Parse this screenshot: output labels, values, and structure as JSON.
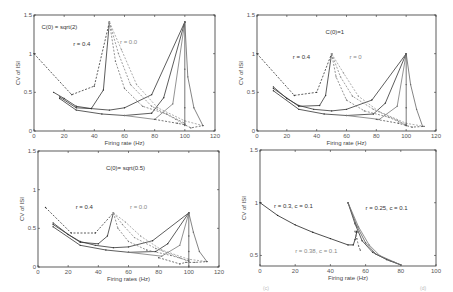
{
  "chart_data": [
    {
      "type": "line",
      "panel": "top-left",
      "annotations": [
        {
          "text": "C(0) = sqrt(2)",
          "x": 5,
          "y": 1.32
        },
        {
          "text": "r = 0.4",
          "x": 26,
          "y": 1.1
        },
        {
          "text": "r = 0.0",
          "x": 57,
          "y": 1.12,
          "light": true
        }
      ],
      "xlabel": "Firing rate (Hz)",
      "ylabel": "CV of ISI",
      "xlim": [
        0,
        120
      ],
      "ylim": [
        0,
        1.5
      ],
      "xticks": [
        0,
        20,
        40,
        60,
        80,
        100,
        120
      ],
      "yticks": [
        0,
        0.5,
        1,
        1.5
      ],
      "ytick_labels": [
        "0",
        "0.5",
        "1",
        "1.5"
      ],
      "series": [
        {
          "name": "r=0.4 dashed",
          "style": "dashed",
          "color": "#333333",
          "x": [
            0,
            25,
            40,
            50
          ],
          "y": [
            1.0,
            0.47,
            0.58,
            1.41
          ]
        },
        {
          "name": "r=0.4 branch a",
          "style": "solid",
          "color": "#333333",
          "x": [
            13,
            20,
            28,
            38,
            50,
            60,
            78,
            100
          ],
          "y": [
            0.5,
            0.42,
            0.32,
            0.29,
            0.27,
            0.3,
            0.47,
            1.41
          ]
        },
        {
          "name": "r=0.4 branch b",
          "style": "solid",
          "color": "#333333",
          "x": [
            17,
            28,
            38,
            46,
            50
          ],
          "y": [
            0.44,
            0.3,
            0.29,
            0.53,
            1.41
          ]
        },
        {
          "name": "r=0 low",
          "style": "solid",
          "color": "#333333",
          "x": [
            17,
            28,
            45,
            60,
            78,
            86,
            100
          ],
          "y": [
            0.42,
            0.27,
            0.22,
            0.2,
            0.23,
            0.43,
            1.41
          ]
        },
        {
          "name": "r=0 drop1",
          "style": "dashed",
          "color": "#777777",
          "x": [
            50,
            54,
            60,
            72,
            88,
            100
          ],
          "y": [
            1.41,
            0.9,
            0.55,
            0.32,
            0.22,
            0.1
          ]
        },
        {
          "name": "r=0 drop2",
          "style": "dashed",
          "color": "#888888",
          "x": [
            50,
            56,
            64,
            78,
            94,
            100
          ],
          "y": [
            1.41,
            1.0,
            0.6,
            0.32,
            0.15,
            0.08
          ]
        },
        {
          "name": "r=0 drop3",
          "style": "dashed",
          "color": "#999999",
          "x": [
            50,
            58,
            68,
            82,
            100,
            112
          ],
          "y": [
            1.41,
            1.05,
            0.6,
            0.3,
            0.13,
            0.07
          ]
        },
        {
          "name": "r=0 rise1",
          "style": "solid",
          "color": "#777777",
          "x": [
            60,
            80,
            92,
            100
          ],
          "y": [
            0.2,
            0.15,
            0.35,
            1.41
          ]
        },
        {
          "name": "peak100 drop",
          "style": "solid",
          "color": "#555555",
          "x": [
            100,
            100,
            100,
            100
          ],
          "y": [
            1.41,
            0.8,
            0.3,
            0.07
          ]
        },
        {
          "name": "peak100 drop right",
          "style": "solid",
          "color": "#666666",
          "x": [
            100,
            102,
            106,
            112
          ],
          "y": [
            1.41,
            0.7,
            0.3,
            0.07
          ]
        },
        {
          "name": "tail dashed",
          "style": "dashed",
          "color": "#555555",
          "x": [
            80,
            95,
            100,
            104,
            112
          ],
          "y": [
            0.15,
            0.1,
            0.08,
            0.04,
            0.07
          ]
        }
      ]
    },
    {
      "type": "line",
      "panel": "top-right",
      "annotations": [
        {
          "text": "C(0)=1",
          "x": 46,
          "y": 1.25
        },
        {
          "text": "r = 0.4",
          "x": 24,
          "y": 0.93
        },
        {
          "text": "r = 0",
          "x": 62,
          "y": 0.93,
          "light": true
        }
      ],
      "xlabel": "Firing rate (Hz)",
      "ylabel": "CV of ISI",
      "xlim": [
        0,
        120
      ],
      "ylim": [
        0,
        1.5
      ],
      "xticks": [
        0,
        20,
        40,
        60,
        80,
        100,
        120
      ],
      "yticks": [
        0,
        0.5,
        1,
        1.5
      ],
      "ytick_labels": [
        "0",
        "0.5",
        "1",
        "1.5"
      ],
      "series": [
        {
          "name": "r=0.4 dashed",
          "style": "dashed",
          "color": "#333333",
          "x": [
            0,
            25,
            40,
            50
          ],
          "y": [
            1.0,
            0.46,
            0.5,
            1.0
          ]
        },
        {
          "name": "r=0.4 branch a",
          "style": "solid",
          "color": "#333333",
          "x": [
            11,
            20,
            28,
            38,
            50,
            60,
            77,
            100
          ],
          "y": [
            0.57,
            0.42,
            0.33,
            0.28,
            0.26,
            0.28,
            0.4,
            1.0
          ]
        },
        {
          "name": "r=0.4 branch b",
          "style": "solid",
          "color": "#333333",
          "x": [
            11,
            28,
            42,
            46,
            50
          ],
          "y": [
            0.55,
            0.32,
            0.33,
            0.46,
            1.0
          ]
        },
        {
          "name": "r=0 low",
          "style": "solid",
          "color": "#333333",
          "x": [
            11,
            28,
            45,
            60,
            78,
            86,
            100
          ],
          "y": [
            0.52,
            0.28,
            0.22,
            0.2,
            0.22,
            0.36,
            1.0
          ]
        },
        {
          "name": "r=0 drop1",
          "style": "dashed",
          "color": "#777777",
          "x": [
            50,
            53,
            60,
            72,
            88,
            100
          ],
          "y": [
            1.0,
            0.7,
            0.4,
            0.26,
            0.18,
            0.08
          ]
        },
        {
          "name": "r=0 drop2",
          "style": "dashed",
          "color": "#888888",
          "x": [
            50,
            56,
            64,
            78,
            94,
            100
          ],
          "y": [
            1.0,
            0.7,
            0.45,
            0.28,
            0.14,
            0.07
          ]
        },
        {
          "name": "r=0 drop3",
          "style": "dashed",
          "color": "#999999",
          "x": [
            50,
            58,
            68,
            82,
            100,
            112
          ],
          "y": [
            1.0,
            0.75,
            0.45,
            0.25,
            0.1,
            0.06
          ]
        },
        {
          "name": "r=0 rise1",
          "style": "solid",
          "color": "#777777",
          "x": [
            60,
            82,
            94,
            100
          ],
          "y": [
            0.2,
            0.15,
            0.32,
            1.0
          ]
        },
        {
          "name": "peak100 drop",
          "style": "solid",
          "color": "#555555",
          "x": [
            100,
            100,
            100,
            100
          ],
          "y": [
            1.0,
            0.6,
            0.3,
            0.07
          ]
        },
        {
          "name": "peak100 drop right",
          "style": "solid",
          "color": "#666666",
          "x": [
            100,
            103,
            107,
            111
          ],
          "y": [
            1.0,
            0.6,
            0.28,
            0.06
          ]
        },
        {
          "name": "tail dashed",
          "style": "dashed",
          "color": "#555555",
          "x": [
            80,
            95,
            100,
            104,
            112
          ],
          "y": [
            0.15,
            0.1,
            0.07,
            0.05,
            0.06
          ]
        }
      ]
    },
    {
      "type": "line",
      "panel": "bottom-left",
      "annotations": [
        {
          "text": "C(0)= sqrt(0.5)",
          "x": 45,
          "y": 1.25
        },
        {
          "text": "r = 0.4",
          "x": 25,
          "y": 0.75
        },
        {
          "text": "r = 0.0",
          "x": 61,
          "y": 0.75,
          "light": true
        }
      ],
      "xlabel": "Firing rates (Hz)",
      "ylabel": "CV of ISI",
      "xlim": [
        0,
        120
      ],
      "ylim": [
        0,
        1.5
      ],
      "xticks": [
        0,
        20,
        40,
        60,
        80,
        100,
        120
      ],
      "yticks": [
        0,
        0.5,
        1,
        1.5
      ],
      "ytick_labels": [
        "0",
        "0.5",
        "1",
        "1.5"
      ],
      "series": [
        {
          "name": "r=0.4 dashed",
          "style": "dashed",
          "color": "#333333",
          "x": [
            5,
            22,
            38,
            50
          ],
          "y": [
            0.77,
            0.44,
            0.44,
            0.7
          ]
        },
        {
          "name": "r=0.4 branch a",
          "style": "solid",
          "color": "#333333",
          "x": [
            10,
            20,
            28,
            38,
            50,
            60,
            76,
            100
          ],
          "y": [
            0.57,
            0.42,
            0.33,
            0.28,
            0.25,
            0.26,
            0.34,
            0.7
          ]
        },
        {
          "name": "r=0.4 branch b",
          "style": "solid",
          "color": "#333333",
          "x": [
            10,
            28,
            40,
            46,
            50
          ],
          "y": [
            0.55,
            0.32,
            0.3,
            0.4,
            0.7
          ]
        },
        {
          "name": "r=0 low",
          "style": "solid",
          "color": "#333333",
          "x": [
            10,
            28,
            45,
            60,
            78,
            86,
            100
          ],
          "y": [
            0.52,
            0.28,
            0.22,
            0.19,
            0.2,
            0.3,
            0.7
          ]
        },
        {
          "name": "r=0 drop1",
          "style": "dashed",
          "color": "#777777",
          "x": [
            50,
            53,
            60,
            72,
            88,
            100
          ],
          "y": [
            0.7,
            0.5,
            0.33,
            0.22,
            0.15,
            0.08
          ]
        },
        {
          "name": "r=0 drop2",
          "style": "dashed",
          "color": "#888888",
          "x": [
            50,
            56,
            64,
            78,
            94,
            100
          ],
          "y": [
            0.7,
            0.55,
            0.38,
            0.24,
            0.12,
            0.07
          ]
        },
        {
          "name": "r=0 drop3",
          "style": "dashed",
          "color": "#999999",
          "x": [
            50,
            58,
            68,
            82,
            100,
            112
          ],
          "y": [
            0.7,
            0.58,
            0.4,
            0.22,
            0.1,
            0.07
          ]
        },
        {
          "name": "r=0 rise1",
          "style": "solid",
          "color": "#777777",
          "x": [
            60,
            82,
            94,
            100
          ],
          "y": [
            0.19,
            0.14,
            0.28,
            0.7
          ]
        },
        {
          "name": "peak100 drop",
          "style": "solid",
          "color": "#555555",
          "x": [
            100,
            100,
            100,
            100
          ],
          "y": [
            0.7,
            0.4,
            0.2,
            0.0
          ]
        },
        {
          "name": "peak100 drop right",
          "style": "solid",
          "color": "#666666",
          "x": [
            100,
            103,
            107,
            112
          ],
          "y": [
            0.7,
            0.45,
            0.2,
            0.07
          ]
        },
        {
          "name": "tail dashed",
          "style": "dashed",
          "color": "#555555",
          "x": [
            80,
            94,
            98,
            104,
            112
          ],
          "y": [
            0.12,
            0.04,
            0.06,
            0.06,
            0.07
          ]
        }
      ]
    },
    {
      "type": "line",
      "panel": "bottom-right",
      "annotations": [
        {
          "text": "r = 0.3, c = 0.1",
          "x": 8,
          "y": 0.95
        },
        {
          "text": "r = 0.25, c = 0.1",
          "x": 60,
          "y": 0.93
        },
        {
          "text": "r = 0.38, c = 0.1",
          "x": 20,
          "y": 0.52,
          "light": true
        }
      ],
      "xlabel": "Firing rate (Hz)",
      "ylabel": "CV of ISI",
      "xlim": [
        0,
        100
      ],
      "ylim": [
        0.4,
        1.5
      ],
      "xticks": [
        0,
        20,
        40,
        60,
        80,
        100
      ],
      "yticks": [
        0.5,
        1,
        1.5
      ],
      "ytick_labels": [
        "0.5",
        "1",
        "1.5"
      ],
      "series": [
        {
          "name": "r=0.3 c=0.1",
          "style": "solid",
          "color": "#222222",
          "x": [
            0,
            10,
            20,
            30,
            40,
            50,
            53,
            54,
            55,
            55
          ],
          "y": [
            1.0,
            0.88,
            0.79,
            0.72,
            0.66,
            0.6,
            0.6,
            0.65,
            0.72,
            0.73
          ]
        },
        {
          "name": "r=0.25 c=0.1 a",
          "style": "solid",
          "color": "#333333",
          "x": [
            50,
            54,
            58,
            64,
            72,
            80
          ],
          "y": [
            1.0,
            0.8,
            0.64,
            0.53,
            0.46,
            0.41
          ]
        },
        {
          "name": "r=0.25 c=0.1 b",
          "style": "solid",
          "color": "#555555",
          "x": [
            50,
            55,
            60,
            66,
            74,
            80
          ],
          "y": [
            1.0,
            0.78,
            0.62,
            0.51,
            0.45,
            0.41
          ]
        },
        {
          "name": "r=0.25 c=0.1 c",
          "style": "solid",
          "color": "#777777",
          "x": [
            50,
            56,
            62,
            68,
            76,
            80
          ],
          "y": [
            1.0,
            0.77,
            0.6,
            0.5,
            0.44,
            0.41
          ]
        },
        {
          "name": "r=0.38 c=0.1",
          "style": "dashed",
          "color": "#666666",
          "x": [
            54,
            55,
            56,
            57
          ],
          "y": [
            0.73,
            0.66,
            0.59,
            0.55
          ]
        }
      ]
    }
  ],
  "panels": [
    {
      "id": "a",
      "annotation_0": "C(0) = sqrt(2)",
      "annotation_1": "r = 0.4",
      "annotation_2": "r = 0.0",
      "xlabel": "Firing rate (Hz)",
      "ylabel": "CV of ISI"
    },
    {
      "id": "b",
      "annotation_0": "C(0)=1",
      "annotation_1": "r = 0.4",
      "annotation_2": "r = 0",
      "xlabel": "Firing rate (Hz)",
      "ylabel": "CV of ISI"
    },
    {
      "id": "c",
      "annotation_0": "C(0)= sqrt(0.5)",
      "annotation_1": "r = 0.4",
      "annotation_2": "r = 0.0",
      "xlabel": "Firing rates (Hz)",
      "ylabel": "CV of ISI"
    },
    {
      "id": "d",
      "annotation_0": "r = 0.3, c = 0.1",
      "annotation_1": "r = 0.25, c = 0.1",
      "annotation_2": "r = 0.38, c = 0.1",
      "xlabel": "Firing rate (Hz)",
      "ylabel": "CV of ISI"
    }
  ],
  "footer_labels": [
    "(c)",
    "(d)"
  ]
}
